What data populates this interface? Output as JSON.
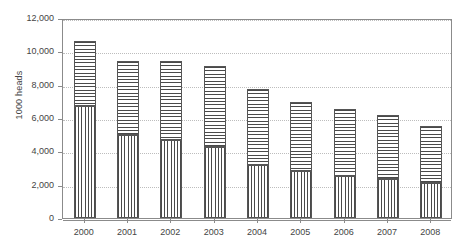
{
  "chart_data": {
    "type": "bar",
    "title": "",
    "subtitle": "",
    "xlabel": "",
    "ylabel": "1000 heads",
    "ylim": [
      0,
      12000
    ],
    "ytick_labels": [
      "12,000",
      "10,000",
      "8,000",
      "6,000",
      "4,000",
      "2,000",
      "0"
    ],
    "ytick_values": [
      12000,
      10000,
      8000,
      6000,
      4000,
      2000,
      0
    ],
    "grid": true,
    "legend": "none",
    "stacked": true,
    "categories": [
      "2000",
      "2001",
      "2002",
      "2003",
      "2004",
      "2005",
      "2006",
      "2007",
      "2008"
    ],
    "series": [
      {
        "name": "lower-segment",
        "pattern": "vertical-hatch",
        "values": [
          6700,
          5000,
          4700,
          4250,
          3200,
          2850,
          2550,
          2350,
          2100
        ]
      },
      {
        "name": "upper-segment",
        "pattern": "horizontal-hatch",
        "values": [
          3950,
          4450,
          4750,
          4900,
          4550,
          4100,
          4000,
          3850,
          3400
        ]
      }
    ],
    "totals": [
      10650,
      9450,
      9450,
      9150,
      7750,
      6950,
      6550,
      6200,
      5500
    ]
  },
  "axes": {
    "y_title": "1000 heads"
  }
}
